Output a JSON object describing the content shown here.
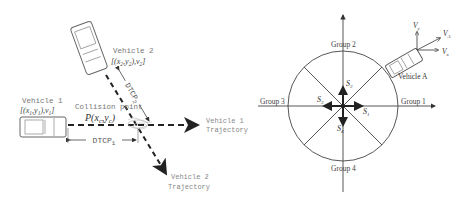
{
  "left_diagram": {
    "vehicle1": {
      "label": "Vehicle 1",
      "state": "[(x",
      "state_full": "[(x1,y1),v1]"
    },
    "vehicle2": {
      "label": "Vehicle 2",
      "state_full": "[(x2,y2),v2]"
    },
    "collision_point": {
      "label": "Collision point",
      "formula": "P(xc,yc)"
    },
    "dtcp1": "DTCP1",
    "dtcp2": "DTCP2",
    "vehicle1_trajectory": [
      "Vehicle 1",
      "Trajectory"
    ],
    "vehicle2_trajectory": [
      "Vehicle 2",
      "Trajectory"
    ]
  },
  "right_diagram": {
    "groups": [
      "Group 1",
      "Group 2",
      "Group 3",
      "Group 4"
    ],
    "sectors": [
      "S1",
      "S2",
      "S3",
      "S4"
    ],
    "vehicle": "Vehicle A",
    "velocity_labels": [
      "Vy",
      "VA",
      "Vx"
    ]
  },
  "colors": {
    "stroke": "#333333",
    "text": "#555555",
    "light_text": "#888888"
  }
}
